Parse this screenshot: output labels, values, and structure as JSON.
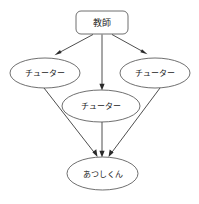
{
  "diagram": {
    "background_color": "#ffffff",
    "node_stroke_color": "#4a4a4a",
    "edge_color": "#3a3a3a",
    "text_color": "#1a1a1a",
    "nodes": {
      "teacher": {
        "label": "教師",
        "shape": "rounded-rectangle",
        "x": 102,
        "y": 22.5,
        "width": 52,
        "height": 23
      },
      "tutor_left": {
        "label": "チューター",
        "shape": "ellipse",
        "x": 45,
        "y": 73,
        "rx": 35,
        "ry": 15
      },
      "tutor_right": {
        "label": "チューター",
        "shape": "ellipse",
        "x": 155,
        "y": 73,
        "rx": 35,
        "ry": 15
      },
      "tutor_center": {
        "label": "チューター",
        "shape": "ellipse",
        "x": 101,
        "y": 106,
        "rx": 39,
        "ry": 16
      },
      "student": {
        "label": "あつしくん",
        "shape": "ellipse",
        "x": 102.5,
        "y": 173.5,
        "rx": 35.5,
        "ry": 16.5
      }
    },
    "edges": [
      {
        "name": "teacher-to-tutor-left",
        "from": "teacher",
        "to": "tutor_left",
        "directed": true
      },
      {
        "name": "teacher-to-tutor-center",
        "from": "teacher",
        "to": "tutor_center",
        "directed": true
      },
      {
        "name": "teacher-to-tutor-right",
        "from": "teacher",
        "to": "tutor_right",
        "directed": true
      },
      {
        "name": "tutor-left-to-student",
        "from": "tutor_left",
        "to": "student",
        "directed": true
      },
      {
        "name": "tutor-center-to-student",
        "from": "tutor_center",
        "to": "student",
        "directed": true
      },
      {
        "name": "tutor-right-to-student",
        "from": "tutor_right",
        "to": "student",
        "directed": true
      }
    ]
  }
}
